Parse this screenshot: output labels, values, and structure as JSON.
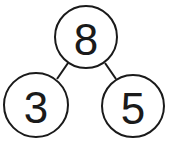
{
  "diagram": {
    "type": "number-bond",
    "whole": {
      "label": "8",
      "cx": 86,
      "cy": 37,
      "r": 31
    },
    "parts": [
      {
        "label": "3",
        "cx": 36,
        "cy": 105,
        "r": 32
      },
      {
        "label": "5",
        "cx": 133,
        "cy": 106,
        "r": 31
      }
    ],
    "colors": {
      "stroke": "#1a1a1a",
      "fill": "#ffffff",
      "background": "#ffffff"
    }
  }
}
